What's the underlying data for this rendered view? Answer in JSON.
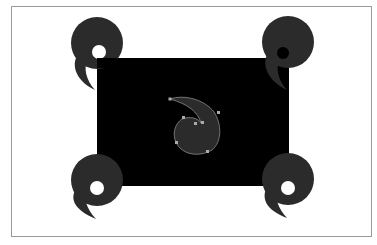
{
  "canvas": {
    "background": "#ffffff",
    "artboard_border": "#9a9a9a"
  },
  "shapes": {
    "rectangle": {
      "fill": "#000000",
      "x": 97,
      "y": 58,
      "width": 192,
      "height": 128
    },
    "corner_swirl_fill": "#2b2b2b",
    "center_swirl": {
      "fill": "#2b2b2b",
      "stroke": "#8a8a8a",
      "selected": true,
      "anchor_color": "#aaaaaa"
    }
  }
}
